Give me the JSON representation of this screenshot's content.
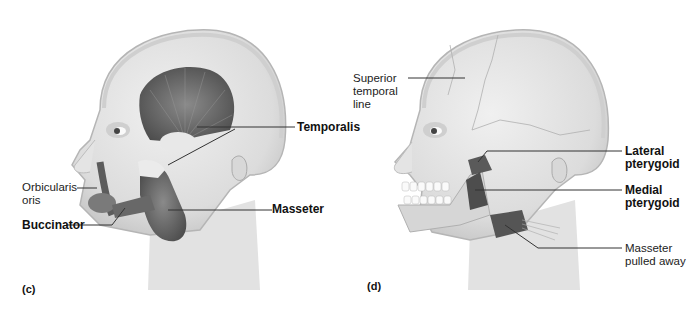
{
  "figure": {
    "panels": [
      {
        "id": "c",
        "letter": "(c)",
        "labels": {
          "temporalis": "Temporalis",
          "orbicularis_oris": "Orbicularis\noris",
          "buccinator": "Buccinator",
          "masseter": "Masseter"
        }
      },
      {
        "id": "d",
        "letter": "(d)",
        "labels": {
          "superior_temporal_line": "Superior\ntemporal\nline",
          "lateral_pterygoid": "Lateral\npterygoid",
          "medial_pterygoid": "Medial\npterygoid",
          "masseter_pulled_away": "Masseter\npulled away"
        }
      }
    ],
    "colors": {
      "skin": "#e6e6e6",
      "skin_shadow": "#c9c9c9",
      "muscle": "#6e6e6e",
      "muscle_dark": "#4a4a4a",
      "leader_line": "#333333"
    }
  }
}
